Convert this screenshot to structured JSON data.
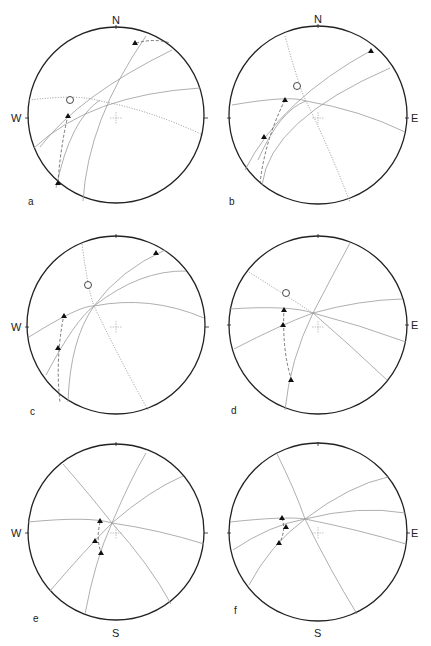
{
  "figure": {
    "panels": [
      {
        "id": "a",
        "label": "a",
        "compass": {
          "top": "N",
          "left": "W"
        }
      },
      {
        "id": "b",
        "label": "b",
        "compass": {
          "top": "N",
          "right": "E"
        }
      },
      {
        "id": "c",
        "label": "c",
        "compass": {
          "left": "W"
        }
      },
      {
        "id": "d",
        "label": "d",
        "compass": {
          "right": "E"
        }
      },
      {
        "id": "e",
        "label": "e",
        "compass": {
          "left": "W",
          "bottom": "S"
        }
      },
      {
        "id": "f",
        "label": "f",
        "compass": {
          "right": "E",
          "bottom": "S"
        }
      }
    ],
    "legend_symbols": {
      "triangle": "filled-triangle-pole",
      "circle": "open-circle-pole",
      "solid_arc": "great-circle",
      "dotted_arc": "dotted-great-circle",
      "dashed_arc": "dashed-small-circle",
      "center": "center-cross"
    }
  }
}
